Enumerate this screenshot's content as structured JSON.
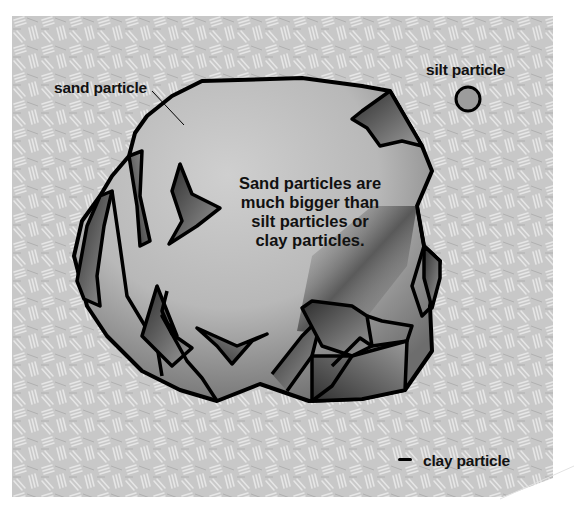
{
  "diagram": {
    "labels": {
      "sand": "sand particle",
      "silt": "silt particle",
      "clay": "clay particle"
    },
    "caption": [
      "Sand particles are",
      "much bigger than",
      "silt particles or",
      "clay particles."
    ],
    "colors": {
      "background_texture": "#c9c9c9",
      "rock_light": "#bdbdbd",
      "rock_dark": "#3a3a3a",
      "outline": "#000000",
      "text": "#111111"
    }
  }
}
